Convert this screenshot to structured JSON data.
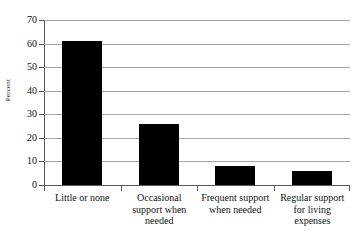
{
  "chart_data": {
    "type": "bar",
    "title": "",
    "xlabel": "",
    "ylabel": "Percent",
    "ylim": [
      0,
      70
    ],
    "ytick_step": 10,
    "yticks": [
      "0",
      "10",
      "20",
      "30",
      "40",
      "50",
      "60",
      "70"
    ],
    "grid": true,
    "legend": false,
    "categories": [
      "Little or none",
      "Occasional support when needed",
      "Frequent support when needed",
      "Regular support for living expenses"
    ],
    "category_lines": [
      [
        "Little or none"
      ],
      [
        "Occasional",
        "support when",
        "needed"
      ],
      [
        "Frequent support",
        "when needed"
      ],
      [
        "Regular support",
        "for living",
        "expenses"
      ]
    ],
    "values": [
      61,
      26,
      8,
      6
    ],
    "bar_color": "#000000",
    "grid_color": "#a7a7a7",
    "axis_color": "#5a5a5a"
  },
  "colors": {
    "background": "#ffffff",
    "text": "#111111",
    "bar": "#000000",
    "grid": "#a7a7a7",
    "axis": "#5a5a5a"
  }
}
